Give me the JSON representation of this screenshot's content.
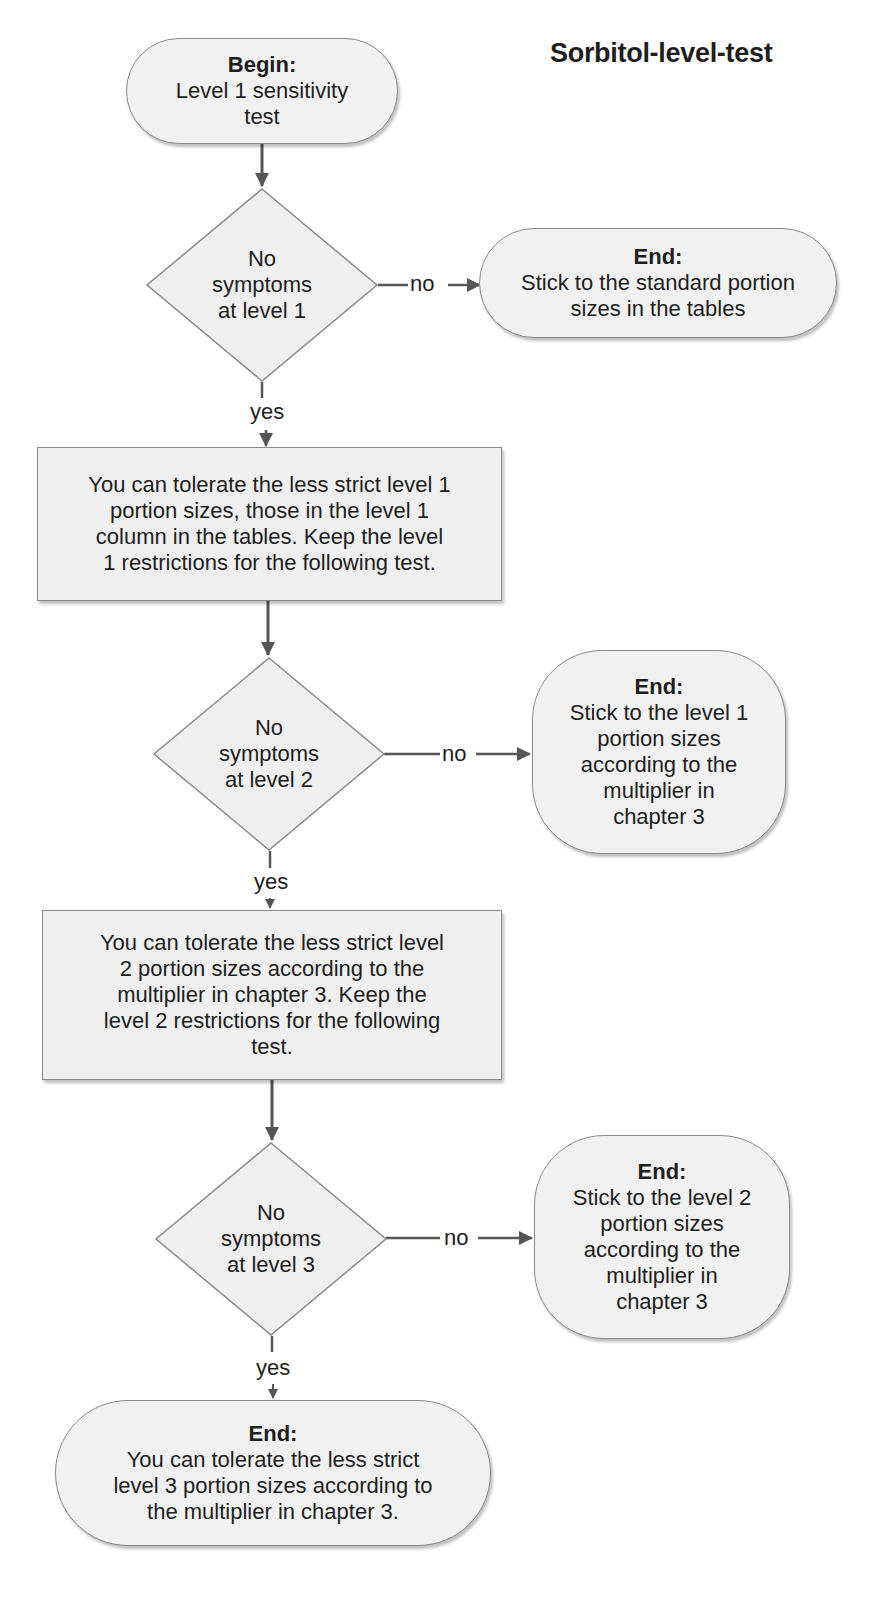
{
  "title": "Sorbitol-level-test",
  "colors": {
    "shape_fill": "#efefef",
    "shape_border": "#8a8a8a",
    "arrow": "#555555",
    "text": "#1e1e1e"
  },
  "nodes": {
    "begin": {
      "heading": "Begin:",
      "lines": [
        "Level 1 sensitivity",
        "test"
      ]
    },
    "decision1": {
      "lines": [
        "No",
        "symptoms",
        "at level 1"
      ]
    },
    "end1": {
      "heading": "End:",
      "lines": [
        "Stick to the standard portion",
        "sizes in the tables"
      ]
    },
    "result1": {
      "lines": [
        "You can tolerate the less strict level 1",
        "portion sizes, those in the level 1",
        "column in the tables. Keep the level",
        "1 restrictions for the following test."
      ]
    },
    "decision2": {
      "lines": [
        "No",
        "symptoms",
        "at level 2"
      ]
    },
    "end2": {
      "heading": "End:",
      "lines": [
        "Stick to the level 1",
        "portion sizes",
        "according to the",
        "multiplier in",
        "chapter 3"
      ]
    },
    "result2": {
      "lines": [
        "You can tolerate the less strict level",
        "2 portion sizes according to the",
        "multiplier in chapter 3. Keep the",
        "level 2 restrictions for the following",
        "test."
      ]
    },
    "decision3": {
      "lines": [
        "No",
        "symptoms",
        "at level 3"
      ]
    },
    "end3": {
      "heading": "End:",
      "lines": [
        "Stick to the level 2",
        "portion sizes",
        "according to the",
        "multiplier in",
        "chapter 3"
      ]
    },
    "end4": {
      "heading": "End:",
      "lines": [
        "You can tolerate the less strict",
        "level 3 portion sizes according to",
        "the multiplier in chapter 3."
      ]
    }
  },
  "edge_labels": {
    "no1": "no",
    "yes1": "yes",
    "no2": "no",
    "yes2": "yes",
    "no3": "no",
    "yes3": "yes"
  }
}
